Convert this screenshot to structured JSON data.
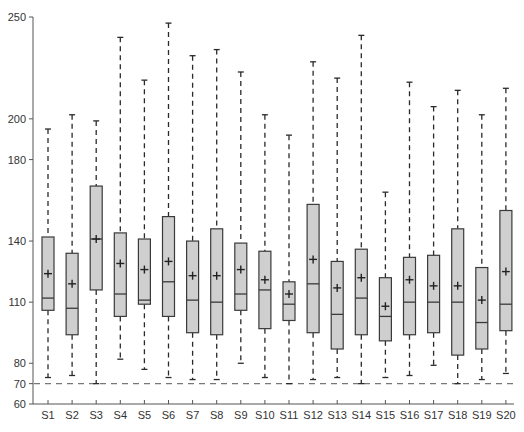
{
  "chart_data": {
    "type": "box",
    "title": "",
    "xlabel": "",
    "ylabel": "",
    "ylim": [
      60,
      250
    ],
    "yticks": [
      60,
      70,
      80,
      110,
      140,
      180,
      200,
      250
    ],
    "grid": false,
    "reference_line": {
      "value": 70,
      "style": "dashed"
    },
    "categories": [
      "S1",
      "S2",
      "S3",
      "S4",
      "S5",
      "S6",
      "S7",
      "S8",
      "S9",
      "S10",
      "S11",
      "S12",
      "S13",
      "S14",
      "S15",
      "S16",
      "S17",
      "S18",
      "S19",
      "S20"
    ],
    "series": [
      {
        "name": "S1",
        "whisker_low": 73,
        "q1": 106,
        "median": 112,
        "mean": 124,
        "q3": 142,
        "whisker_high": 195
      },
      {
        "name": "S2",
        "whisker_low": 74,
        "q1": 94,
        "median": 107,
        "mean": 119,
        "q3": 134,
        "whisker_high": 202
      },
      {
        "name": "S3",
        "whisker_low": 70,
        "q1": 116,
        "median": 141,
        "mean": 141,
        "q3": 167,
        "whisker_high": 199
      },
      {
        "name": "S4",
        "whisker_low": 82,
        "q1": 103,
        "median": 114,
        "mean": 129,
        "q3": 144,
        "whisker_high": 240
      },
      {
        "name": "S5",
        "whisker_low": 77,
        "q1": 109,
        "median": 111,
        "mean": 126,
        "q3": 141,
        "whisker_high": 219
      },
      {
        "name": "S6",
        "whisker_low": 73,
        "q1": 103,
        "median": 120,
        "mean": 130,
        "q3": 152,
        "whisker_high": 247
      },
      {
        "name": "S7",
        "whisker_low": 72,
        "q1": 95,
        "median": 111,
        "mean": 123,
        "q3": 140,
        "whisker_high": 231
      },
      {
        "name": "S8",
        "whisker_low": 72,
        "q1": 94,
        "median": 110,
        "mean": 123,
        "q3": 146,
        "whisker_high": 234
      },
      {
        "name": "S9",
        "whisker_low": 80,
        "q1": 106,
        "median": 114,
        "mean": 126,
        "q3": 139,
        "whisker_high": 223
      },
      {
        "name": "S10",
        "whisker_low": 73,
        "q1": 97,
        "median": 116,
        "mean": 121,
        "q3": 135,
        "whisker_high": 202
      },
      {
        "name": "S11",
        "whisker_low": 70,
        "q1": 101,
        "median": 109,
        "mean": 114,
        "q3": 120,
        "whisker_high": 192
      },
      {
        "name": "S12",
        "whisker_low": 72,
        "q1": 95,
        "median": 119,
        "mean": 131,
        "q3": 158,
        "whisker_high": 228
      },
      {
        "name": "S13",
        "whisker_low": 73,
        "q1": 87,
        "median": 104,
        "mean": 117,
        "q3": 130,
        "whisker_high": 220
      },
      {
        "name": "S14",
        "whisker_low": 70,
        "q1": 94,
        "median": 112,
        "mean": 122,
        "q3": 136,
        "whisker_high": 241
      },
      {
        "name": "S15",
        "whisker_low": 73,
        "q1": 91,
        "median": 103,
        "mean": 108,
        "q3": 122,
        "whisker_high": 164
      },
      {
        "name": "S16",
        "whisker_low": 74,
        "q1": 94,
        "median": 110,
        "mean": 121,
        "q3": 132,
        "whisker_high": 218
      },
      {
        "name": "S17",
        "whisker_low": 79,
        "q1": 95,
        "median": 110,
        "mean": 118,
        "q3": 133,
        "whisker_high": 206
      },
      {
        "name": "S18",
        "whisker_low": 70,
        "q1": 84,
        "median": 110,
        "mean": 118,
        "q3": 146,
        "whisker_high": 214
      },
      {
        "name": "S19",
        "whisker_low": 72,
        "q1": 87,
        "median": 100,
        "mean": 111,
        "q3": 127,
        "whisker_high": 202
      },
      {
        "name": "S20",
        "whisker_low": 75,
        "q1": 96,
        "median": 109,
        "mean": 125,
        "q3": 155,
        "whisker_high": 215
      }
    ]
  },
  "style": {
    "box_fill": "#cfcfcf",
    "box_stroke": "#3a3a3a",
    "whisker_color": "#2a2a2a",
    "axis_color": "#555555",
    "reference_line_color": "#777777"
  }
}
